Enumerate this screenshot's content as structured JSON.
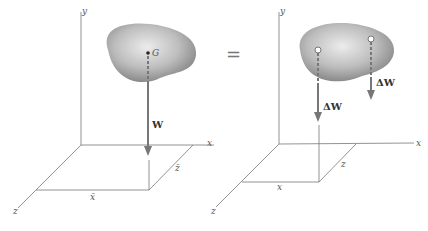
{
  "diagram": {
    "left": {
      "axes": {
        "x": "x",
        "y": "y",
        "z": "z"
      },
      "point_label": "G",
      "force_label": "W",
      "coord_labels": {
        "x_bar": "x̄",
        "z_bar": "z̄"
      }
    },
    "equals": "=",
    "right": {
      "axes": {
        "x": "x",
        "y": "y",
        "z": "z"
      },
      "force_labels": [
        "ΔW",
        "ΔW"
      ],
      "coord_labels": {
        "x": "x",
        "z": "z"
      }
    }
  }
}
